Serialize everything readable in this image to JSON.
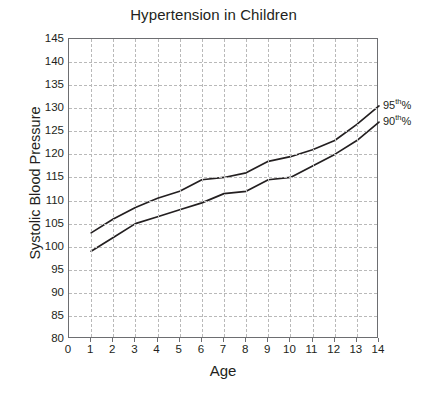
{
  "chart_data": {
    "type": "line",
    "title": "Hypertension in Children",
    "xlabel": "Age",
    "ylabel": "Systolic Blood Pressure",
    "xlim": [
      0,
      14
    ],
    "ylim": [
      80,
      145
    ],
    "xticks": [
      0,
      1,
      2,
      3,
      4,
      5,
      6,
      7,
      8,
      9,
      10,
      11,
      12,
      13,
      14
    ],
    "yticks": [
      80,
      85,
      90,
      95,
      100,
      105,
      110,
      115,
      120,
      125,
      130,
      135,
      140,
      145
    ],
    "grid": true,
    "grid_style": "dashed",
    "grid_color": "#b9b9b9",
    "legend_position": "right-end-of-line",
    "x": [
      1,
      2,
      3,
      4,
      5,
      6,
      7,
      8,
      9,
      10,
      11,
      12,
      13,
      14
    ],
    "series": [
      {
        "name": "95th%",
        "label_html": "95<sup>th</sup>%",
        "color": "#231f20",
        "values": [
          103,
          106,
          108.5,
          110.5,
          112,
          114.5,
          115,
          116,
          118.5,
          119.5,
          121,
          123,
          126.5,
          130.5
        ]
      },
      {
        "name": "90th%",
        "label_html": "90<sup>th</sup>%",
        "color": "#231f20",
        "values": [
          99,
          102,
          105,
          106.5,
          108,
          109.5,
          111.5,
          112,
          114.5,
          115,
          117.5,
          120,
          123,
          127
        ]
      }
    ]
  },
  "caption": {
    "text": ""
  }
}
